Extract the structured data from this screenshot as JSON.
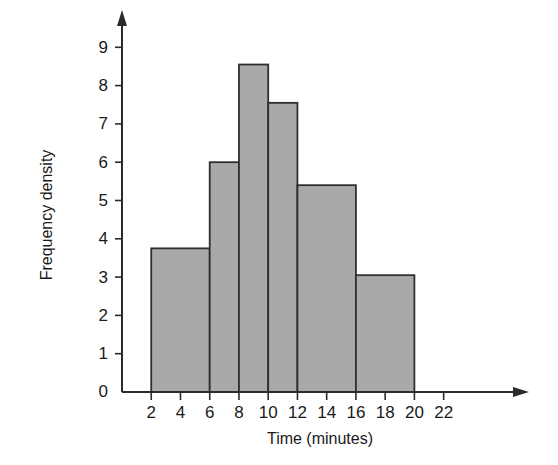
{
  "question": {
    "number": "7."
  },
  "chart_data": {
    "type": "bar",
    "title": "",
    "xlabel": "Time (minutes)",
    "ylabel": "Frequency density",
    "xlim": [
      0,
      23
    ],
    "ylim": [
      0,
      9.4
    ],
    "grid": false,
    "legend": null,
    "x_ticks": [
      "2",
      "4",
      "6",
      "8",
      "10",
      "12",
      "14",
      "16",
      "18",
      "20",
      "22"
    ],
    "x_tick_values": [
      2,
      4,
      6,
      8,
      10,
      12,
      14,
      16,
      18,
      20,
      22
    ],
    "y_ticks": [
      "0",
      "1",
      "2",
      "3",
      "4",
      "5",
      "6",
      "7",
      "8",
      "9"
    ],
    "y_tick_values": [
      0,
      1,
      2,
      3,
      4,
      5,
      6,
      7,
      8,
      9
    ],
    "bin_edges": [
      2,
      6,
      8,
      10,
      12,
      16,
      20
    ],
    "categories": [
      "2-6",
      "6-8",
      "8-10",
      "10-12",
      "12-16",
      "16-20"
    ],
    "values": [
      3.75,
      6.0,
      8.55,
      7.55,
      5.4,
      3.05
    ],
    "bars": [
      {
        "label": "2-6",
        "x0": 2,
        "x1": 6,
        "height": 3.75
      },
      {
        "label": "6-8",
        "x0": 6,
        "x1": 8,
        "height": 6.0
      },
      {
        "label": "8-10",
        "x0": 8,
        "x1": 10,
        "height": 8.55
      },
      {
        "label": "10-12",
        "x0": 10,
        "x1": 12,
        "height": 7.55
      },
      {
        "label": "12-16",
        "x0": 12,
        "x1": 16,
        "height": 5.4
      },
      {
        "label": "16-20",
        "x0": 16,
        "x1": 20,
        "height": 3.05
      }
    ],
    "colors": {
      "bar_fill": "#a9a9a9",
      "bar_stroke": "#2f2f2f",
      "axis": "#2b2b2b",
      "text": "#1a1a1a",
      "background": "#ffffff"
    }
  }
}
